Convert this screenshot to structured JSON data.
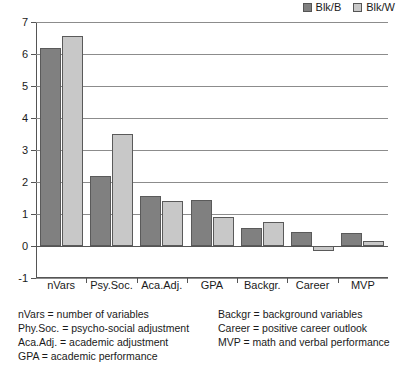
{
  "chart_data": {
    "type": "bar",
    "title": "",
    "subtitle": "",
    "xlabel": "",
    "ylabel": "",
    "categories": [
      "nVars",
      "Psy.Soc.",
      "Aca.Adj.",
      "GPA",
      "Backgr.",
      "Career",
      "MVP"
    ],
    "series": [
      {
        "name": "Blk/B",
        "color": "#808080",
        "values": [
          6.2,
          2.2,
          1.55,
          1.45,
          0.55,
          0.43,
          0.4
        ]
      },
      {
        "name": "Blk/W",
        "color": "#c8c8c8",
        "values": [
          6.55,
          3.5,
          1.4,
          0.9,
          0.75,
          -0.15,
          0.15
        ]
      }
    ],
    "ylim": [
      -1,
      7
    ],
    "ytick_labels": [
      "7",
      "6",
      "5",
      "4",
      "3",
      "2",
      "1",
      "0",
      "-1"
    ],
    "ytick_values": [
      7,
      6,
      5,
      4,
      3,
      2,
      1,
      0,
      -1
    ],
    "grid": true,
    "legend_position": "top-right"
  },
  "legend": {
    "entries": [
      {
        "label": "Blk/B",
        "color": "#808080"
      },
      {
        "label": "Blk/W",
        "color": "#c8c8c8"
      }
    ]
  },
  "footnotes": {
    "left": [
      "nVars = number of variables",
      "Phy.Soc. = psycho-social adjustment",
      "Aca.Adj. = academic adjustment",
      "GPA = academic performance"
    ],
    "right": [
      "Backgr = background variables",
      "Career = positive career outlook",
      "MVP = math and verbal performance"
    ]
  }
}
